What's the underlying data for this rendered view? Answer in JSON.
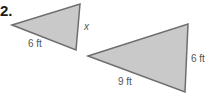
{
  "problem": {
    "number": "2."
  },
  "triangles": [
    {
      "name": "small",
      "side_labels": {
        "bottom": "6 ft",
        "right": "x"
      },
      "fill": "#c9c9c9",
      "stroke": "#6e6e6e"
    },
    {
      "name": "large",
      "side_labels": {
        "bottom": "9 ft",
        "right": "6 ft"
      },
      "fill": "#c9c9c9",
      "stroke": "#6e6e6e"
    }
  ]
}
